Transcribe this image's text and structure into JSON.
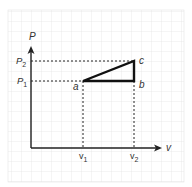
{
  "diagram": {
    "type": "pv-diagram",
    "axes": {
      "y_label": "P",
      "x_label": "v",
      "y_ticks": [
        {
          "label": "P",
          "sub": "2",
          "y": 61
        },
        {
          "label": "P",
          "sub": "1",
          "y": 81
        }
      ],
      "x_ticks": [
        {
          "label": "v",
          "sub": "1",
          "x": 83
        },
        {
          "label": "v",
          "sub": "2",
          "x": 134
        }
      ]
    },
    "points": [
      {
        "name": "a",
        "x": 83,
        "y": 81
      },
      {
        "name": "b",
        "x": 134,
        "y": 81
      },
      {
        "name": "c",
        "x": 134,
        "y": 61
      }
    ],
    "path": [
      "a",
      "b",
      "c",
      "a"
    ],
    "colors": {
      "grid": "#d8d8d8",
      "axis": "#222222",
      "path": "#111111",
      "dashed": "#222222",
      "background": "#ffffff"
    }
  }
}
